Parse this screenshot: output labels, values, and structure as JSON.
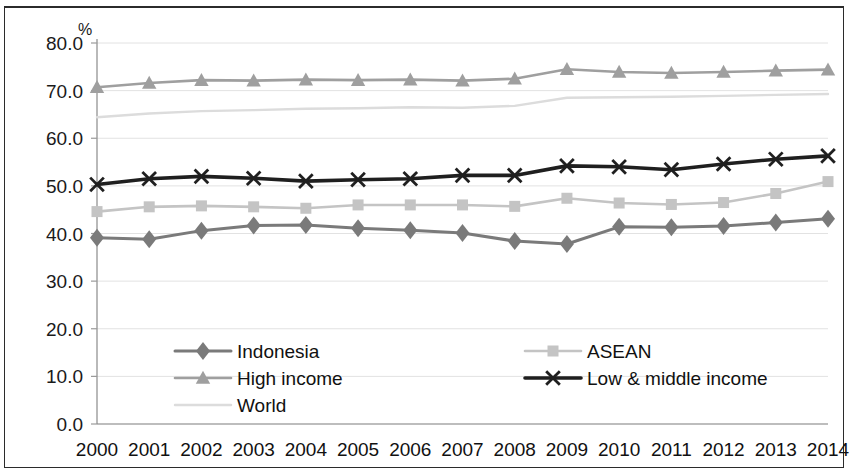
{
  "chart_data": {
    "type": "line",
    "title": "",
    "xlabel": "",
    "ylabel": "%",
    "unit_label": "%",
    "ylim": [
      0,
      80
    ],
    "ytick_step": 10,
    "grid": false,
    "legend_position": "inside-bottom",
    "categories": [
      "2000",
      "2001",
      "2002",
      "2003",
      "2004",
      "2005",
      "2006",
      "2007",
      "2008",
      "2009",
      "2010",
      "2011",
      "2012",
      "2013",
      "2014"
    ],
    "ytick_labels": [
      "80.0",
      "70.0",
      "60.0",
      "50.0",
      "40.0",
      "30.0",
      "20.0",
      "10.0",
      "0.0"
    ],
    "ytick_values": [
      80,
      70,
      60,
      50,
      40,
      30,
      20,
      10,
      0
    ],
    "series": [
      {
        "name": "Indonesia",
        "marker": "diamond",
        "color": "#7a7a7a",
        "line_width": 3.0,
        "marker_size": 9,
        "values": [
          39.1,
          38.8,
          40.6,
          41.7,
          41.8,
          41.1,
          40.7,
          40.1,
          38.4,
          37.8,
          41.4,
          41.3,
          41.6,
          42.3,
          43.1
        ]
      },
      {
        "name": "High income",
        "marker": "triangle",
        "color": "#9f9f9f",
        "line_width": 2.6,
        "marker_size": 10,
        "values": [
          70.7,
          71.6,
          72.2,
          72.1,
          72.3,
          72.2,
          72.3,
          72.1,
          72.5,
          74.5,
          73.9,
          73.7,
          73.9,
          74.2,
          74.4
        ]
      },
      {
        "name": "World",
        "marker": "none",
        "color": "#dcdcdc",
        "line_width": 2.4,
        "marker_size": 8,
        "values": [
          64.4,
          65.2,
          65.7,
          65.9,
          66.2,
          66.3,
          66.5,
          66.4,
          66.8,
          68.5,
          68.6,
          68.7,
          68.9,
          69.1,
          69.3
        ]
      },
      {
        "name": "ASEAN",
        "marker": "square",
        "color": "#c4c4c4",
        "line_width": 2.6,
        "marker_size": 11,
        "values": [
          44.6,
          45.6,
          45.8,
          45.6,
          45.3,
          46.0,
          46.0,
          46.0,
          45.7,
          47.4,
          46.4,
          46.1,
          46.5,
          48.4,
          50.9
        ]
      },
      {
        "name": "Low & middle income",
        "marker": "cross",
        "color": "#1f1f1f",
        "line_width": 3.6,
        "marker_size": 11,
        "values": [
          50.3,
          51.5,
          52.0,
          51.6,
          51.0,
          51.3,
          51.5,
          52.2,
          52.2,
          54.2,
          54.0,
          53.4,
          54.6,
          55.6,
          56.3
        ]
      }
    ],
    "legend": [
      {
        "label": "Indonesia",
        "marker": "diamond",
        "color": "#7a7a7a",
        "column": 0,
        "row": 0
      },
      {
        "label": "ASEAN",
        "marker": "square",
        "color": "#c4c4c4",
        "column": 1,
        "row": 0
      },
      {
        "label": "High income",
        "marker": "triangle",
        "color": "#9f9f9f",
        "column": 0,
        "row": 1
      },
      {
        "label": "Low & middle income",
        "marker": "cross",
        "color": "#1f1f1f",
        "column": 1,
        "row": 1
      },
      {
        "label": "World",
        "marker": "none",
        "color": "#dcdcdc",
        "column": 0,
        "row": 2
      }
    ]
  },
  "layout": {
    "plot_left": 97,
    "plot_right": 828,
    "plot_top": 43,
    "plot_bottom": 424,
    "legend_col_x": [
      175,
      525
    ],
    "legend_row_y": [
      351,
      378,
      405
    ],
    "legend_swatch_width": 56
  }
}
